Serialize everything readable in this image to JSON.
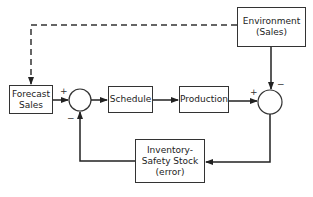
{
  "diagram": {
    "type": "feedback-control-block-diagram",
    "blocks": {
      "environment": {
        "line1": "Environment",
        "line2": "(Sales)"
      },
      "forecast": {
        "line1": "Forecast",
        "line2": "Sales"
      },
      "schedule": {
        "label": "Schedule"
      },
      "production": {
        "label": "Production"
      },
      "inventory": {
        "line1": "Inventory-",
        "line2": "Safety Stock",
        "line3": "(error)"
      }
    },
    "summing_junctions": {
      "left": {
        "plus": "+",
        "minus": "−"
      },
      "right": {
        "plus": "+",
        "minus": "−"
      }
    },
    "edges": [
      {
        "from": "environment",
        "to": "forecast",
        "style": "dashed"
      },
      {
        "from": "forecast",
        "to": "left-junction",
        "sign": "+"
      },
      {
        "from": "left-junction",
        "to": "schedule"
      },
      {
        "from": "schedule",
        "to": "production"
      },
      {
        "from": "production",
        "to": "right-junction",
        "sign": "+"
      },
      {
        "from": "environment",
        "to": "right-junction",
        "sign": "−"
      },
      {
        "from": "right-junction",
        "to": "inventory"
      },
      {
        "from": "inventory",
        "to": "left-junction",
        "sign": "−"
      }
    ]
  }
}
